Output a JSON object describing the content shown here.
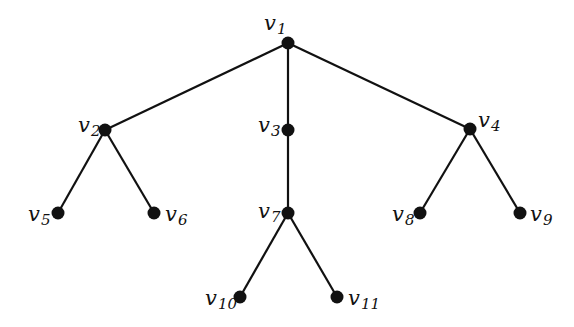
{
  "diagram": {
    "type": "tree",
    "colors": {
      "node": "#111111",
      "edge": "#111111",
      "background": "#ffffff"
    },
    "nodes": [
      {
        "id": "v1",
        "base": "v",
        "sub": "1",
        "x": 288,
        "y": 43,
        "label_x": 264,
        "label_y": 30,
        "anchor": "start"
      },
      {
        "id": "v2",
        "base": "v",
        "sub": "2",
        "x": 105,
        "y": 130,
        "label_x": 78,
        "label_y": 132,
        "anchor": "start"
      },
      {
        "id": "v3",
        "base": "v",
        "sub": "3",
        "x": 288,
        "y": 130,
        "label_x": 258,
        "label_y": 132,
        "anchor": "start"
      },
      {
        "id": "v4",
        "base": "v",
        "sub": "4",
        "x": 470,
        "y": 129,
        "label_x": 478,
        "label_y": 127,
        "anchor": "start"
      },
      {
        "id": "v5",
        "base": "v",
        "sub": "5",
        "x": 58,
        "y": 213,
        "label_x": 28,
        "label_y": 221,
        "anchor": "start"
      },
      {
        "id": "v6",
        "base": "v",
        "sub": "6",
        "x": 154,
        "y": 213,
        "label_x": 165,
        "label_y": 221,
        "anchor": "start"
      },
      {
        "id": "v7",
        "base": "v",
        "sub": "7",
        "x": 288,
        "y": 213,
        "label_x": 258,
        "label_y": 218,
        "anchor": "start"
      },
      {
        "id": "v8",
        "base": "v",
        "sub": "8",
        "x": 420,
        "y": 213,
        "label_x": 392,
        "label_y": 221,
        "anchor": "start"
      },
      {
        "id": "v9",
        "base": "v",
        "sub": "9",
        "x": 520,
        "y": 213,
        "label_x": 530,
        "label_y": 221,
        "anchor": "start"
      },
      {
        "id": "v10",
        "base": "v",
        "sub": "10",
        "x": 240,
        "y": 297,
        "label_x": 205,
        "label_y": 305,
        "anchor": "start"
      },
      {
        "id": "v11",
        "base": "v",
        "sub": "11",
        "x": 337,
        "y": 297,
        "label_x": 348,
        "label_y": 305,
        "anchor": "start"
      }
    ],
    "edges": [
      [
        "v1",
        "v2"
      ],
      [
        "v1",
        "v3"
      ],
      [
        "v1",
        "v4"
      ],
      [
        "v2",
        "v5"
      ],
      [
        "v2",
        "v6"
      ],
      [
        "v3",
        "v7"
      ],
      [
        "v4",
        "v8"
      ],
      [
        "v4",
        "v9"
      ],
      [
        "v7",
        "v10"
      ],
      [
        "v7",
        "v11"
      ]
    ]
  }
}
